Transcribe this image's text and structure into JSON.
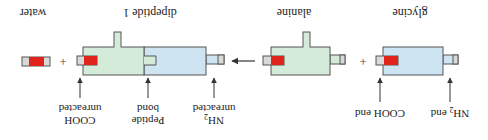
{
  "orientation": "rotated-180",
  "colors": {
    "glycine_fill": "#cfe4f3",
    "alanine_fill": "#d3ebd8",
    "cooh_red": "#e0241b",
    "cap_gray": "#d9d9d9",
    "outline": "#555555",
    "arrow": "#333333"
  },
  "molecules": {
    "glycine": {
      "label": "glycine"
    },
    "alanine": {
      "label": "alanine"
    },
    "dipeptide": {
      "label": "dipeptide 1"
    },
    "water": {
      "label": "water"
    }
  },
  "operators": {
    "plus": "+"
  },
  "annotations": {
    "glycine_nh2": {
      "line1": "NH",
      "sub": "2",
      "line1_suffix": " end"
    },
    "glycine_cooh": {
      "line1": "COOH end"
    },
    "dipeptide_nh2": {
      "line1": "NH",
      "sub": "2",
      "line2": "unreacted"
    },
    "peptide_bond": {
      "line1": "Peptide",
      "line2": "bond"
    },
    "dipeptide_cooh": {
      "line1": "COOH",
      "line2": "unreacted"
    }
  }
}
